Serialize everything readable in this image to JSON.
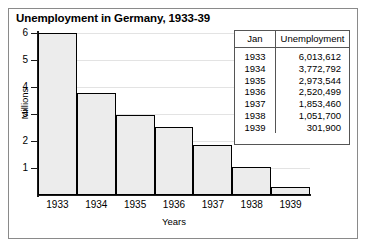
{
  "chart_data": {
    "type": "bar",
    "title": "Unemployment in Germany, 1933-39",
    "xlabel": "Years",
    "ylabel": "Millions",
    "categories": [
      "1933",
      "1934",
      "1935",
      "1936",
      "1937",
      "1938",
      "1939"
    ],
    "values": [
      6013612,
      3772792,
      2973544,
      2520499,
      1853460,
      1051700,
      301900
    ],
    "values_millions": [
      6.013612,
      3.772792,
      2.973544,
      2.520499,
      1.85346,
      1.0517,
      0.3019
    ],
    "ylim": [
      0,
      6
    ],
    "yticks": [
      1,
      2,
      3,
      4,
      5,
      6
    ],
    "ytick_labels": [
      "1",
      "2",
      "3",
      "4",
      "5",
      "6"
    ],
    "grid": true,
    "legend": "none",
    "bar_fill": "#ececec",
    "bar_edge": "#000000"
  },
  "table": {
    "headers": [
      "Jan",
      "Unemployment"
    ],
    "rows": [
      {
        "year": "1933",
        "value": "6,013,612"
      },
      {
        "year": "1934",
        "value": "3,772,792"
      },
      {
        "year": "1935",
        "value": "2,973,544"
      },
      {
        "year": "1936",
        "value": "2,520,499"
      },
      {
        "year": "1937",
        "value": "1,853,460"
      },
      {
        "year": "1938",
        "value": "1,051,700"
      },
      {
        "year": "1939",
        "value": "301,900"
      }
    ]
  }
}
